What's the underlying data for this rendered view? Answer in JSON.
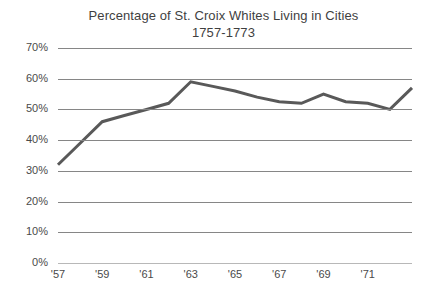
{
  "chart_data": {
    "type": "line",
    "title": "Percentage of St. Croix Whites Living in Cities",
    "subtitle": "1757-1773",
    "xlabel": "",
    "ylabel": "",
    "ylim": [
      0,
      70
    ],
    "xlim": [
      1757,
      1773
    ],
    "grid": true,
    "legend": "none",
    "y_ticks": [
      "0%",
      "10%",
      "20%",
      "30%",
      "40%",
      "50%",
      "60%",
      "70%"
    ],
    "y_tick_values": [
      0,
      10,
      20,
      30,
      40,
      50,
      60,
      70
    ],
    "x_ticks": [
      "'57",
      "'59",
      "'61",
      "'63",
      "'65",
      "'67",
      "'69",
      "'71"
    ],
    "x_tick_values": [
      1757,
      1759,
      1761,
      1763,
      1765,
      1767,
      1769,
      1771
    ],
    "x": [
      1757,
      1758,
      1759,
      1760,
      1761,
      1762,
      1763,
      1764,
      1765,
      1766,
      1767,
      1768,
      1769,
      1770,
      1771,
      1772,
      1773
    ],
    "series": [
      {
        "name": "Percentage of whites living in cities",
        "color": "#595959",
        "values": [
          32,
          39,
          46,
          48,
          50,
          52,
          59,
          57.5,
          56,
          54,
          52.5,
          52,
          55,
          52.5,
          52,
          50,
          57
        ]
      }
    ]
  }
}
